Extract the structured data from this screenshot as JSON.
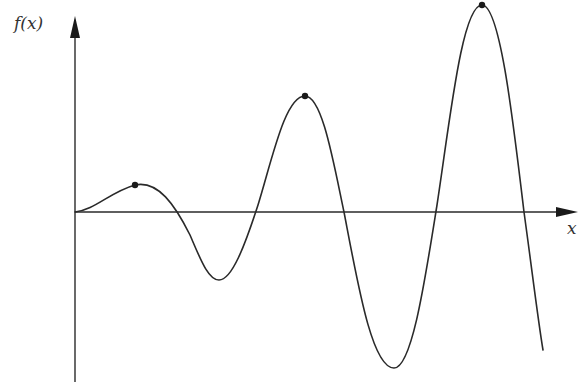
{
  "diagram": {
    "y_axis_label": "f(x)",
    "x_axis_label": "x",
    "colors": {
      "stroke": "#2a2a2a",
      "label": "#333333",
      "background": "#ffffff"
    },
    "origin": {
      "x": 75,
      "y": 212
    },
    "marked_points": [
      {
        "name": "local-max-1",
        "x": 135,
        "y": 185
      },
      {
        "name": "local-max-2",
        "x": 305,
        "y": 96
      },
      {
        "name": "local-max-3",
        "x": 482,
        "y": 5
      }
    ]
  }
}
